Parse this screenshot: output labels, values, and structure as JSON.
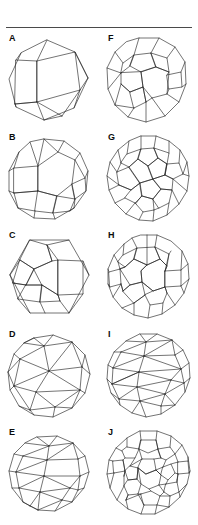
{
  "plate": {
    "title": "Archimedean solids plate",
    "divider": "horizontal-rule",
    "columns": 2,
    "rows": 5,
    "line_color": "#1d1d1d",
    "rule_color": "#4a4a4a",
    "background": "#ffffff",
    "label_color": "#0b0b0b"
  },
  "panels": [
    {
      "label": "A",
      "name": "truncated-octahedron",
      "column": "left",
      "row": 1,
      "description": "Wireframe polyhedron with square and hexagonal faces seen in oblique view"
    },
    {
      "label": "B",
      "name": "rhombicuboctahedron",
      "column": "left",
      "row": 2,
      "description": "Wireframe polyhedron with squares and triangles around a large central face"
    },
    {
      "label": "C",
      "name": "snub-cube",
      "column": "left",
      "row": 3,
      "description": "Wireframe polyhedron with triangles and squares in chiral arrangement"
    },
    {
      "label": "D",
      "name": "icosidodecahedron",
      "column": "left",
      "row": 4,
      "description": "Wireframe polyhedron of triangles and pentagons"
    },
    {
      "label": "E",
      "name": "snub-dodecahedron-small",
      "column": "left",
      "row": 5,
      "description": "Near-spherical wireframe polyhedron of triangles and pentagons"
    },
    {
      "label": "F",
      "name": "truncated-cuboctahedron",
      "column": "right",
      "row": 1,
      "description": "Wireframe polyhedron with squares, hexagons and octagons"
    },
    {
      "label": "G",
      "name": "truncated-icosahedron",
      "column": "right",
      "row": 2,
      "description": "Soccer-ball wireframe of pentagons and hexagons"
    },
    {
      "label": "H",
      "name": "rhombicosidodecahedron",
      "column": "right",
      "row": 3,
      "description": "Wireframe polyhedron of squares, triangles and pentagons"
    },
    {
      "label": "I",
      "name": "snub-dodecahedron",
      "column": "right",
      "row": 4,
      "description": "Dense triangular wireframe sphere with pentagonal faces"
    },
    {
      "label": "J",
      "name": "truncated-icosidodecahedron",
      "column": "right",
      "row": 5,
      "description": "Wireframe polyhedron of squares, hexagons and decagons"
    }
  ]
}
